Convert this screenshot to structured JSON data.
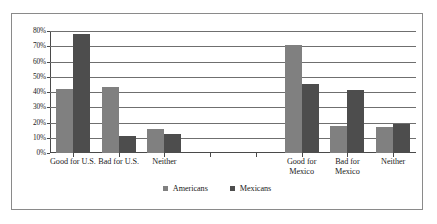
{
  "chart_data": {
    "type": "bar",
    "title": "",
    "subtitle": "",
    "xlabel": "",
    "ylabel": "",
    "ylim": [
      0,
      80
    ],
    "ytick_labels": [
      "80%",
      "70%",
      "60%",
      "50%",
      "40%",
      "30%",
      "20%",
      "10%",
      "0%"
    ],
    "ytick_values": [
      80,
      70,
      60,
      50,
      40,
      30,
      20,
      10,
      0
    ],
    "grid": true,
    "legend_position": "bottom",
    "categories": [
      "Good for U.S.",
      "Bad for U.S.",
      "Neither",
      "",
      "",
      "Good for\nMexico",
      "Bad for\nMexico",
      "Neither"
    ],
    "series": [
      {
        "name": "Americans",
        "color": "#808080",
        "values": [
          42,
          43,
          15.5,
          null,
          null,
          71,
          17.5,
          17
        ]
      },
      {
        "name": "Mexicans",
        "color": "#4d4d4d",
        "values": [
          78,
          11,
          12.5,
          null,
          null,
          45,
          41,
          19
        ]
      }
    ]
  },
  "legend": {
    "entries": [
      {
        "label": "Americans",
        "color": "#808080"
      },
      {
        "label": "Mexicans",
        "color": "#4d4d4d"
      }
    ]
  },
  "frame": {
    "border_color": "#8a8a8a",
    "background": "#ffffff"
  }
}
